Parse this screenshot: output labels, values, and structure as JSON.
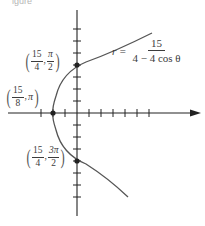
{
  "figure": {
    "caption_fragment": "igure",
    "equation": {
      "lhs": "r =",
      "numerator": "15",
      "denominator": "4 − 4 cos θ"
    },
    "points": [
      {
        "id": "pi_over_2",
        "r_num": "15",
        "r_den": "4",
        "theta": "π",
        "theta_den": "2",
        "label_text": "(15/4, π/2)"
      },
      {
        "id": "pi",
        "r_num": "15",
        "r_den": "8",
        "theta": "π",
        "label_text": "(15/8, π)"
      },
      {
        "id": "three_pi_over_2",
        "r_num": "15",
        "r_den": "4",
        "theta": "3π",
        "theta_den": "2",
        "label_text": "(15/4, 3π/2)"
      }
    ],
    "colors": {
      "axis": "#222222",
      "curve": "#555555",
      "point": "#222222",
      "text": "#3c3c3c"
    }
  }
}
